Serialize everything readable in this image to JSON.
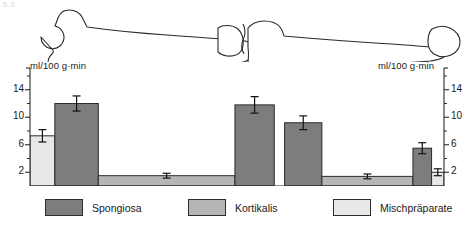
{
  "figure": {
    "corner_mark": "5.6",
    "bone_label": "bone-outline-femur-tibia",
    "axis_label_left": "ml/100 g·min",
    "axis_label_right": "ml/100 g·min"
  },
  "legend": {
    "items": [
      {
        "label": "Spongiosa",
        "color": "#7d7d7d"
      },
      {
        "label": "Kortikalis",
        "color": "#b5b5b5"
      },
      {
        "label": "Mischpräparate",
        "color": "#e8e8e8"
      }
    ]
  },
  "chart_data": {
    "type": "bar",
    "title": "",
    "xlabel": "",
    "ylabel": "ml/100 g·min",
    "ylim": [
      0,
      16
    ],
    "yticks": [
      2,
      6,
      10,
      14
    ],
    "ytick_labels": [
      "2",
      "6",
      "10",
      "14"
    ],
    "minor_ticks": [
      4,
      8,
      12,
      16
    ],
    "grid": false,
    "legend_position": "bottom",
    "axis_left_labels": [
      "14",
      "10",
      "6",
      "2"
    ],
    "axis_right_labels": [
      "14",
      "10",
      "6",
      "2"
    ],
    "categories": [
      "Mischpräparate (prox. Epiphyse)",
      "Spongiosa (prox. Metaphyse)",
      "Kortikalis (Femurschaft)",
      "Spongiosa (dist. Femur)",
      "Spongiosa (prox. Tibia)",
      "Kortikalis (Tibiaschaft)",
      "Spongiosa (dist. Tibia)",
      "Mischpräparate (dist. Epiphyse)"
    ],
    "series": [
      {
        "name": "Knochendurchblutung",
        "values": [
          7.3,
          12.0,
          1.5,
          11.8,
          9.2,
          1.4,
          5.5,
          2.0
        ],
        "errors": [
          0.9,
          1.1,
          0.35,
          1.2,
          1.0,
          0.35,
          0.8,
          0.5
        ],
        "types": [
          "Mischpräparate",
          "Spongiosa",
          "Kortikalis",
          "Spongiosa",
          "Spongiosa",
          "Kortikalis",
          "Spongiosa",
          "Mischpräparate"
        ]
      }
    ],
    "bar_geometry": [
      {
        "x": 0.0,
        "w": 6.0
      },
      {
        "x": 6.0,
        "w": 10.5
      },
      {
        "x": 16.5,
        "w": 33.0
      },
      {
        "x": 49.5,
        "w": 9.5
      },
      {
        "x": 61.5,
        "w": 9.0
      },
      {
        "x": 70.5,
        "w": 22.0
      },
      {
        "x": 92.5,
        "w": 4.5
      },
      {
        "x": 97.0,
        "w": 3.0
      }
    ]
  }
}
